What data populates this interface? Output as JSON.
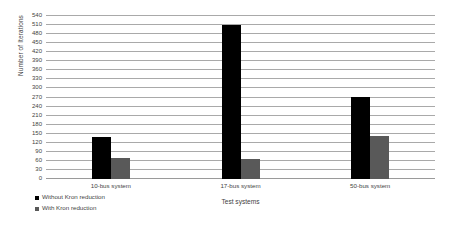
{
  "chart_data": {
    "type": "bar",
    "title": "",
    "xlabel": "Test systems",
    "ylabel": "Number of Iterations",
    "categories": [
      "10-bus system",
      "17-bus system",
      "50-bus system"
    ],
    "series": [
      {
        "name": "Without Kron reduction",
        "color": "#000000",
        "values": [
          140,
          510,
          273
        ]
      },
      {
        "name": "With Kron reduction",
        "color": "#595959",
        "values": [
          70,
          65,
          142
        ]
      }
    ],
    "ylim": [
      0,
      540
    ],
    "ytick_step": 30,
    "yticks": [
      0,
      30,
      60,
      90,
      120,
      150,
      180,
      210,
      240,
      270,
      300,
      330,
      360,
      390,
      420,
      450,
      480,
      510,
      540
    ],
    "grid": true,
    "grid_axis": "y",
    "legend_position": "bottom-left",
    "legend": [
      "Without Kron reduction",
      "With Kron reduction"
    ]
  }
}
